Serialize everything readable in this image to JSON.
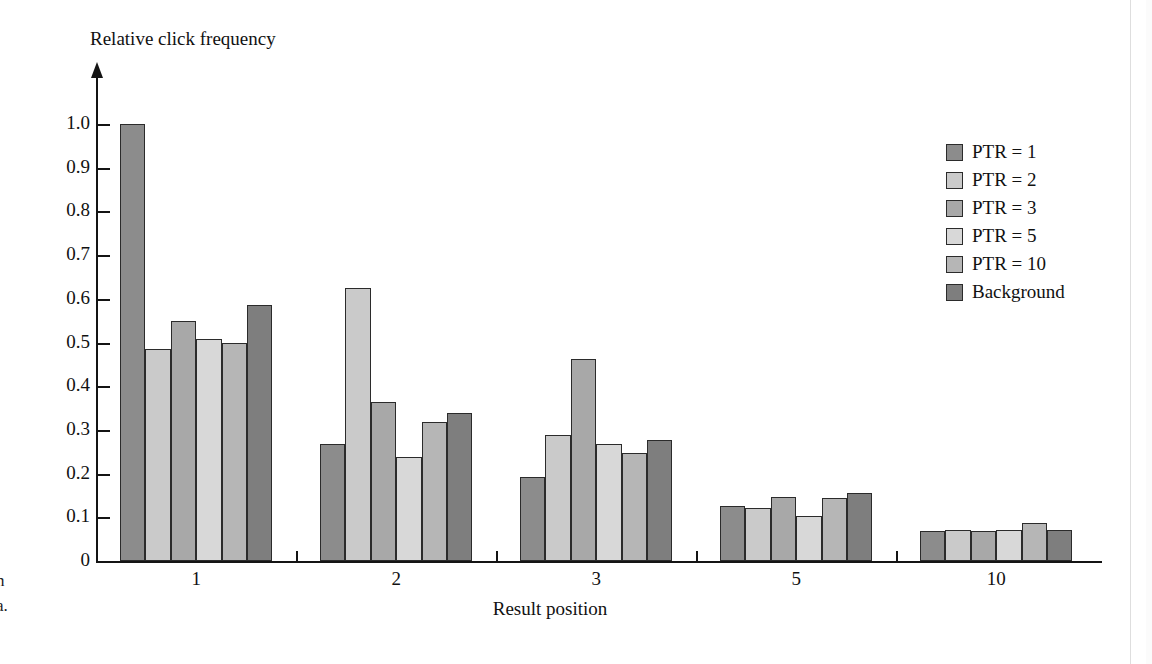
{
  "figure": {
    "clipped_caption_line1": "n",
    "clipped_caption_line2": "a."
  },
  "chart_data": {
    "type": "bar",
    "title": "",
    "xlabel": "Result position",
    "ylabel": "Relative click frequency",
    "categories": [
      "1",
      "2",
      "3",
      "5",
      "10"
    ],
    "ylim": [
      0,
      1.05
    ],
    "ytick_labels": [
      "0",
      "0.1",
      "0.2",
      "0.3",
      "0.4",
      "0.5",
      "0.6",
      "0.7",
      "0.8",
      "0.9",
      "1.0"
    ],
    "ytick_values": [
      0,
      0.1,
      0.2,
      0.3,
      0.4,
      0.5,
      0.6,
      0.7,
      0.8,
      0.9,
      1.0
    ],
    "grid": false,
    "legend_position": "right",
    "series": [
      {
        "name": "PTR = 1",
        "color": "#8c8c8c",
        "values": [
          1.0,
          0.268,
          0.193,
          0.125,
          0.068
        ]
      },
      {
        "name": "PTR = 2",
        "color": "#cacaca",
        "values": [
          0.485,
          0.625,
          0.289,
          0.122,
          0.072
        ]
      },
      {
        "name": "PTR = 3",
        "color": "#a8a8a8",
        "values": [
          0.55,
          0.364,
          0.463,
          0.147,
          0.068
        ]
      },
      {
        "name": "PTR = 5",
        "color": "#d8d8d8",
        "values": [
          0.509,
          0.237,
          0.267,
          0.103,
          0.071
        ]
      },
      {
        "name": "PTR = 10",
        "color": "#b6b6b6",
        "values": [
          0.5,
          0.319,
          0.248,
          0.144,
          0.086
        ]
      },
      {
        "name": "Background",
        "color": "#7e7e7e",
        "values": [
          0.585,
          0.338,
          0.277,
          0.155,
          0.072
        ]
      }
    ]
  }
}
